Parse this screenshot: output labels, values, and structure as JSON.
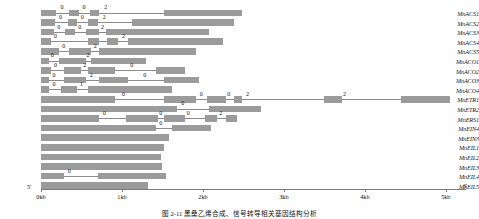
{
  "figure": {
    "caption": "图 2-11  黑桑乙烯合成、信号转导相关基因结构分析",
    "end_5_label": "5'",
    "end_3_label": "3'",
    "axis": {
      "ticks": [
        {
          "label": "0kb",
          "kb": 0
        },
        {
          "label": "1kb",
          "kb": 1
        },
        {
          "label": "2kb",
          "kb": 2
        },
        {
          "label": "3kb",
          "kb": 3
        },
        {
          "label": "4kb",
          "kb": 4
        },
        {
          "label": "5kb",
          "kb": 5
        }
      ],
      "min_kb": 0,
      "max_kb": 5.2
    },
    "colors": {
      "exon": "#9b9b9b",
      "intron": "#8a8a8a",
      "axis": "#7a7a7a",
      "text": "#111111"
    }
  },
  "chart_data": {
    "type": "gene-structure-diagram",
    "title": "黑桑乙烯合成、信号转导相关基因结构分析",
    "xlabel": "",
    "ylabel": "",
    "xlim": [
      0,
      5.2
    ],
    "x_unit": "kb",
    "grid": false,
    "legend": [],
    "genes": [
      {
        "name": "MnACS1",
        "length_kb": 2.48,
        "exons": [
          [
            0.0,
            0.18
          ],
          [
            0.35,
            0.47
          ],
          [
            0.6,
            0.72
          ],
          [
            1.52,
            2.48
          ]
        ],
        "introns": [
          [
            0.18,
            0.35
          ],
          [
            0.47,
            0.6
          ],
          [
            0.72,
            1.52
          ]
        ],
        "phases": [
          {
            "value": "0",
            "kb": 0.26
          },
          {
            "value": "0",
            "kb": 0.53
          },
          {
            "value": "2",
            "kb": 0.8
          }
        ]
      },
      {
        "name": "MnACS2",
        "length_kb": 2.38,
        "exons": [
          [
            0.0,
            0.17
          ],
          [
            0.33,
            0.45
          ],
          [
            0.58,
            0.7
          ],
          [
            1.12,
            2.38
          ]
        ],
        "introns": [
          [
            0.17,
            0.33
          ],
          [
            0.45,
            0.58
          ],
          [
            0.7,
            1.12
          ]
        ],
        "phases": [
          {
            "value": "0",
            "kb": 0.24
          },
          {
            "value": "0",
            "kb": 0.51
          },
          {
            "value": "2",
            "kb": 0.78
          }
        ]
      },
      {
        "name": "MnACS3",
        "length_kb": 2.08,
        "exons": [
          [
            0.0,
            0.16
          ],
          [
            0.3,
            0.42
          ],
          [
            0.55,
            0.72
          ],
          [
            0.8,
            2.08
          ]
        ],
        "introns": [
          [
            0.16,
            0.3
          ],
          [
            0.42,
            0.55
          ],
          [
            0.72,
            0.8
          ]
        ],
        "phases": [
          {
            "value": "0",
            "kb": 0.22
          },
          {
            "value": "0",
            "kb": 0.48
          },
          {
            "value": "2",
            "kb": 0.76
          }
        ]
      },
      {
        "name": "MnACS4",
        "length_kb": 2.25,
        "exons": [
          [
            0.0,
            0.12
          ],
          [
            0.58,
            0.72
          ],
          [
            0.82,
            0.95
          ],
          [
            1.08,
            2.25
          ]
        ],
        "introns": [
          [
            0.12,
            0.58
          ],
          [
            0.72,
            0.82
          ],
          [
            0.95,
            1.08
          ]
        ],
        "phases": [
          {
            "value": "0",
            "kb": 0.18
          },
          {
            "value": "2",
            "kb": 1.02
          }
        ]
      },
      {
        "name": "MnACS5",
        "length_kb": 1.92,
        "exons": [
          [
            0.0,
            0.22
          ],
          [
            0.35,
            0.62
          ],
          [
            0.72,
            1.92
          ]
        ],
        "introns": [
          [
            0.22,
            0.35
          ],
          [
            0.62,
            0.72
          ]
        ],
        "phases": [
          {
            "value": "0",
            "kb": 0.28
          },
          {
            "value": "2",
            "kb": 0.67
          }
        ]
      },
      {
        "name": "MnACO1",
        "length_kb": 1.3,
        "exons": [
          [
            0.0,
            0.1
          ],
          [
            0.22,
            0.55
          ],
          [
            0.62,
            1.3
          ]
        ],
        "introns": [
          [
            0.1,
            0.22
          ],
          [
            0.55,
            0.62
          ]
        ],
        "phases": [
          {
            "value": "0",
            "kb": 0.14
          },
          {
            "value": "2",
            "kb": 0.58
          }
        ]
      },
      {
        "name": "MnACO2",
        "length_kb": 1.78,
        "exons": [
          [
            0.0,
            0.12
          ],
          [
            0.28,
            0.5
          ],
          [
            0.58,
            0.92
          ],
          [
            1.42,
            1.78
          ]
        ],
        "introns": [
          [
            0.12,
            0.28
          ],
          [
            0.5,
            0.58
          ],
          [
            0.92,
            1.42
          ]
        ],
        "phases": [
          {
            "value": "0",
            "kb": 0.18
          },
          {
            "value": "2",
            "kb": 0.54
          },
          {
            "value": "0",
            "kb": 1.12
          }
        ]
      },
      {
        "name": "MnACO3",
        "length_kb": 1.95,
        "exons": [
          [
            0.0,
            0.1
          ],
          [
            0.28,
            0.55
          ],
          [
            0.72,
            1.08
          ],
          [
            1.52,
            1.95
          ]
        ],
        "introns": [
          [
            0.1,
            0.28
          ],
          [
            0.55,
            0.72
          ],
          [
            1.08,
            1.52
          ]
        ],
        "phases": [
          {
            "value": "0",
            "kb": 0.16
          },
          {
            "value": "2",
            "kb": 0.62
          },
          {
            "value": "0",
            "kb": 1.28
          }
        ]
      },
      {
        "name": "MnACO4",
        "length_kb": 1.62,
        "exons": [
          [
            0.0,
            0.1
          ],
          [
            0.25,
            0.45
          ],
          [
            0.58,
            1.62
          ]
        ],
        "introns": [
          [
            0.1,
            0.25
          ],
          [
            0.45,
            0.58
          ]
        ],
        "phases": [
          {
            "value": "0",
            "kb": 0.16
          },
          {
            "value": "1",
            "kb": 0.5
          }
        ]
      },
      {
        "name": "MnETR1",
        "length_kb": 5.05,
        "exons": [
          [
            0.0,
            0.92
          ],
          [
            1.52,
            1.92
          ],
          [
            2.05,
            2.28
          ],
          [
            2.38,
            2.48
          ],
          [
            3.5,
            3.72
          ],
          [
            4.45,
            5.05
          ]
        ],
        "introns": [
          [
            0.92,
            1.52
          ],
          [
            1.92,
            2.05
          ],
          [
            2.28,
            2.38
          ],
          [
            2.48,
            3.5
          ],
          [
            3.72,
            4.45
          ]
        ],
        "phases": [
          {
            "value": "0",
            "kb": 1.02
          },
          {
            "value": "0",
            "kb": 1.98
          },
          {
            "value": "0",
            "kb": 2.32
          },
          {
            "value": "2",
            "kb": 2.55
          },
          {
            "value": "2",
            "kb": 3.75
          }
        ]
      },
      {
        "name": "MnETR2",
        "length_kb": 2.72,
        "exons": [
          [
            0.0,
            1.68
          ],
          [
            2.08,
            2.72
          ]
        ],
        "introns": [
          [
            1.68,
            2.08
          ]
        ],
        "phases": [
          {
            "value": "0",
            "kb": 1.75
          }
        ]
      },
      {
        "name": "MnERS1",
        "length_kb": 2.42,
        "exons": [
          [
            0.0,
            0.72
          ],
          [
            1.05,
            1.45
          ],
          [
            1.52,
            1.78
          ],
          [
            2.02,
            2.18
          ],
          [
            2.28,
            2.42
          ]
        ],
        "introns": [
          [
            0.72,
            1.05
          ],
          [
            1.45,
            1.52
          ],
          [
            1.78,
            2.02
          ],
          [
            2.18,
            2.28
          ]
        ],
        "phases": [
          {
            "value": "0",
            "kb": 0.78
          },
          {
            "value": "0",
            "kb": 1.48
          },
          {
            "value": "0",
            "kb": 1.82
          },
          {
            "value": "2",
            "kb": 2.22
          }
        ]
      },
      {
        "name": "MnEIN4",
        "length_kb": 2.1,
        "exons": [
          [
            0.0,
            1.42
          ],
          [
            1.62,
            2.1
          ]
        ],
        "introns": [
          [
            1.42,
            1.62
          ]
        ],
        "phases": [
          {
            "value": "0",
            "kb": 1.48
          }
        ]
      },
      {
        "name": "MnEIN3",
        "length_kb": 1.58,
        "exons": [
          [
            0.0,
            1.58
          ]
        ],
        "introns": [],
        "phases": []
      },
      {
        "name": "MnEIL1",
        "length_kb": 1.52,
        "exons": [
          [
            0.0,
            1.52
          ]
        ],
        "introns": [],
        "phases": []
      },
      {
        "name": "MnEIL2",
        "length_kb": 1.48,
        "exons": [
          [
            0.0,
            1.48
          ]
        ],
        "introns": [],
        "phases": []
      },
      {
        "name": "MnEIL3",
        "length_kb": 1.5,
        "exons": [
          [
            0.0,
            1.5
          ]
        ],
        "introns": [],
        "phases": []
      },
      {
        "name": "MnEIL4",
        "length_kb": 1.55,
        "exons": [
          [
            0.0,
            0.28
          ],
          [
            0.7,
            1.55
          ]
        ],
        "introns": [
          [
            0.28,
            0.7
          ]
        ],
        "phases": [
          {
            "value": "0",
            "kb": 0.35
          }
        ]
      },
      {
        "name": "MnEIL5",
        "length_kb": 1.32,
        "exons": [
          [
            0.0,
            1.32
          ]
        ],
        "introns": [],
        "phases": []
      }
    ]
  }
}
